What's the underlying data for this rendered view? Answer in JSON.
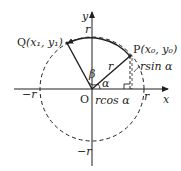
{
  "diagram": {
    "type": "unit-circle-rotation",
    "colors": {
      "stroke": "#231f20",
      "background": "#ffffff"
    },
    "axes": {
      "x_label": "x",
      "y_label": "y",
      "origin_label": "O"
    },
    "circle": {
      "radius_label_top": "r",
      "radius_label_bottom": "−r",
      "radius_label_left": "−r",
      "radius_label_right": "r"
    },
    "points": {
      "P": {
        "name": "P",
        "coords": "(x₀, y₀)"
      },
      "Q": {
        "name": "Q",
        "coords": "(x₁, y₁)"
      }
    },
    "segments": {
      "OP_label": "r",
      "horizontal_label": "rcos α",
      "vertical_label": "rsin α"
    },
    "angles": {
      "alpha": "α",
      "beta": "β"
    }
  }
}
